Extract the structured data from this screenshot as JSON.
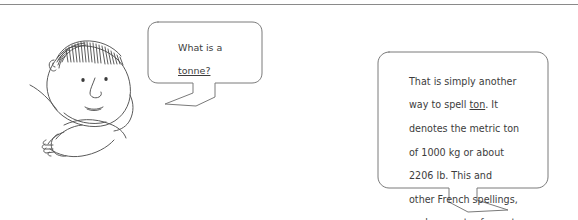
{
  "page": {
    "background_color": "#ffffff",
    "ink_color": "#5a5a5a",
    "text_color": "#3c3c3c",
    "width": 578,
    "height": 220,
    "divider": "horizontal-rule"
  },
  "character": {
    "name": "cartoon-man-head-and-arm",
    "features": [
      "hatched-hair",
      "left-eye",
      "right-eye",
      "nose",
      "mouth",
      "ear",
      "arm",
      "hand"
    ]
  },
  "question_bubble": {
    "speaker": "cartoon-man",
    "tail_direction": "down-left",
    "lines": [
      "What is a",
      "tonne?"
    ],
    "text": "What is a tonne?",
    "emphasis": [
      "tonne"
    ]
  },
  "answer_bubble": {
    "speaker": "off-screen-responder",
    "tail_direction": "down-right",
    "lines": [
      "That is simply another",
      "way to spell ton. It",
      "denotes the metric ton",
      "of 1000 kg or about",
      "2206 lb. This and",
      "other French spellings,",
      "such as metre for meter,",
      "gramme for gram, and",
      "litre for liter, are",
      "common in Europe."
    ],
    "text": "That is simply another way to spell ton. It denotes the metric ton of 1000 kg or about 2206 lb. This and other French spellings, such as metre for meter, gramme for gram, and litre for liter, are common in Europe.",
    "emphasis": [
      "ton",
      "metre",
      "meter",
      "gramme",
      "gram",
      "litre",
      "liter"
    ],
    "values": {
      "metric_ton_kg": "1000 kg",
      "metric_ton_lb": "2206 lb"
    }
  }
}
